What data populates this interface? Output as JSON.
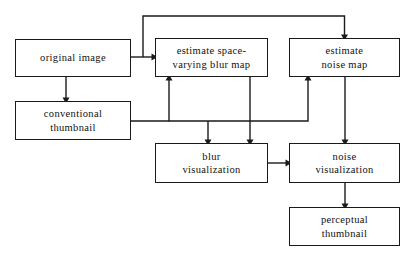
{
  "diagram": {
    "type": "flowchart",
    "background_color": "#ffffff",
    "line_color": "#1a1a1a",
    "text_color": "#111111",
    "nodes": [
      {
        "id": "original-image",
        "label": "original image",
        "x": 15,
        "y": 39,
        "w": 116,
        "h": 38
      },
      {
        "id": "conventional-thumbnail",
        "label": "conventional\nthumbnail",
        "x": 15,
        "y": 101,
        "w": 116,
        "h": 39
      },
      {
        "id": "estimate-blur-map",
        "label": "estimate space-\nvarying blur map",
        "x": 155,
        "y": 38,
        "w": 113,
        "h": 39
      },
      {
        "id": "estimate-noise-map",
        "label": "estimate\nnoise map",
        "x": 289,
        "y": 38,
        "w": 111,
        "h": 39
      },
      {
        "id": "blur-visualization",
        "label": "blur\nvisualization",
        "x": 155,
        "y": 143,
        "w": 113,
        "h": 40
      },
      {
        "id": "noise-visualization",
        "label": "noise\nvisualization",
        "x": 289,
        "y": 143,
        "w": 111,
        "h": 40
      },
      {
        "id": "perceptual-thumbnail",
        "label": "perceptual\nthumbnail",
        "x": 289,
        "y": 207,
        "w": 111,
        "h": 39
      }
    ],
    "edges": [
      {
        "id": "edge-original-to-blur-map",
        "from": "original-image",
        "to": "estimate-blur-map",
        "path": "M 131 57 L 153 57",
        "arrow_at": [
          153,
          57
        ],
        "arrow_dir": "right"
      },
      {
        "id": "edge-original-to-noise-map",
        "from": "original-image",
        "to": "estimate-noise-map",
        "path": "M 143 57 L 143 16 L 344.5 16 L 344.5 36",
        "arrow_at": [
          344.5,
          36
        ],
        "arrow_dir": "down"
      },
      {
        "id": "edge-original-to-conventional-thumbnail",
        "from": "original-image",
        "to": "conventional-thumbnail",
        "path": "M 66 77 L 66 99",
        "arrow_at": [
          66,
          99
        ],
        "arrow_dir": "down"
      },
      {
        "id": "edge-thumbnail-to-blur-map",
        "from": "conventional-thumbnail",
        "to": "estimate-blur-map",
        "path": "M 131 121 L 169 121 L 169 79",
        "arrow_at": [
          169,
          79
        ],
        "arrow_dir": "up"
      },
      {
        "id": "edge-thumbnail-to-noise-map",
        "from": "conventional-thumbnail",
        "to": "estimate-noise-map",
        "path": "M 169 121 L 308 121 L 308 79",
        "arrow_at": [
          308,
          79
        ],
        "arrow_dir": "up"
      },
      {
        "id": "edge-thumbnail-to-blur-visualization",
        "from": "conventional-thumbnail",
        "to": "blur-visualization",
        "path": "M 208 121 L 208 141",
        "arrow_at": [
          208,
          141
        ],
        "arrow_dir": "down"
      },
      {
        "id": "edge-blur-map-to-blur-visualization",
        "from": "estimate-blur-map",
        "to": "blur-visualization",
        "path": "M 250 77 L 250 141",
        "arrow_at": [
          250,
          141
        ],
        "arrow_dir": "down"
      },
      {
        "id": "edge-noise-map-to-noise-visualization",
        "from": "estimate-noise-map",
        "to": "noise-visualization",
        "path": "M 345 77 L 345 141",
        "arrow_at": [
          345,
          141
        ],
        "arrow_dir": "down"
      },
      {
        "id": "edge-blur-visualization-to-noise-visualization",
        "from": "blur-visualization",
        "to": "noise-visualization",
        "path": "M 268 163 L 287 163",
        "arrow_at": [
          287,
          163
        ],
        "arrow_dir": "right"
      },
      {
        "id": "edge-noise-visualization-to-perceptual-thumbnail",
        "from": "noise-visualization",
        "to": "perceptual-thumbnail",
        "path": "M 345 183 L 345 205",
        "arrow_at": [
          345,
          205
        ],
        "arrow_dir": "down"
      }
    ]
  }
}
